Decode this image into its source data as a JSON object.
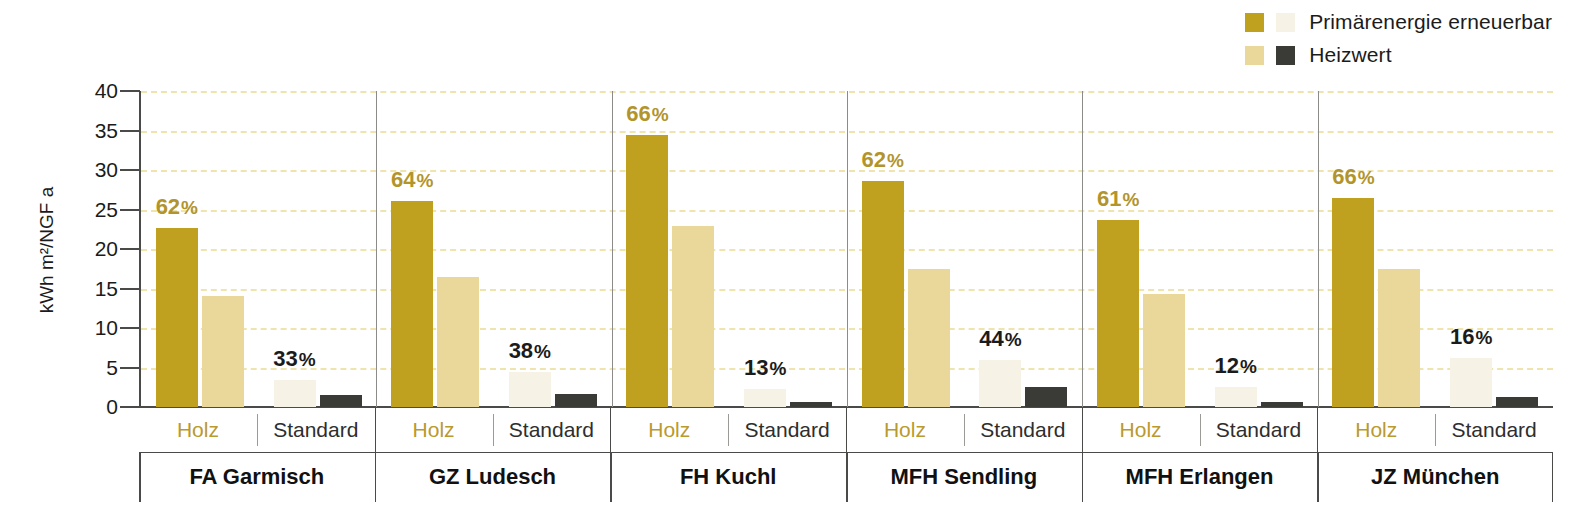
{
  "chart_data": {
    "type": "bar",
    "title": "",
    "xlabel": "",
    "ylabel": "kWh m²/NGF a",
    "ylim": [
      0,
      40
    ],
    "yticks": [
      "0",
      "5",
      "10",
      "15",
      "20",
      "25",
      "30",
      "35",
      "40"
    ],
    "grid": true,
    "legend_position": "top-right",
    "legend": [
      {
        "label": "Primärenergie erneuerbar",
        "swatches": [
          "#c0a11f",
          "#f6f3e6"
        ]
      },
      {
        "label": "Heizwert",
        "swatches": [
          "#e9d89a",
          "#3a3a36"
        ]
      }
    ],
    "subgroups": [
      "Holz",
      "Standard"
    ],
    "series": [
      {
        "name": "Primärenergie erneuerbar (Holz)",
        "color": "#c0a11f",
        "values": [
          22.7,
          26.1,
          34.4,
          28.6,
          23.7,
          26.5
        ]
      },
      {
        "name": "Heizwert (Holz)",
        "color": "#e9d89a",
        "values": [
          14.1,
          16.5,
          22.9,
          17.5,
          14.3,
          17.5
        ]
      },
      {
        "name": "Primärenergie erneuerbar (Standard)",
        "color": "#f6f3e6",
        "values": [
          3.4,
          4.4,
          2.3,
          5.9,
          2.5,
          6.2
        ]
      },
      {
        "name": "Heizwert (Standard)",
        "color": "#3a3a36",
        "values": [
          1.5,
          1.6,
          0.6,
          2.5,
          0.6,
          1.3
        ]
      }
    ],
    "categories": [
      "FA Garmisch",
      "GZ Ludesch",
      "FH Kuchl",
      "MFH Sendling",
      "MFH Erlangen",
      "JZ München"
    ],
    "annotations_holz": [
      "62",
      "64",
      "66",
      "62",
      "61",
      "66"
    ],
    "annotations_standard": [
      "33",
      "38",
      "13",
      "44",
      "12",
      "16"
    ],
    "percent_symbol": "%",
    "colors": {
      "dark_gold": "#c0a11f",
      "mid_yellow": "#e9d89a",
      "pale_cream": "#f6f3e6",
      "charcoal": "#3a3a36",
      "gridline": "#efe4ae",
      "axis": "#4a4a48",
      "holz_label": "#b99a2e",
      "standard_label": "#2e2e2e"
    }
  }
}
